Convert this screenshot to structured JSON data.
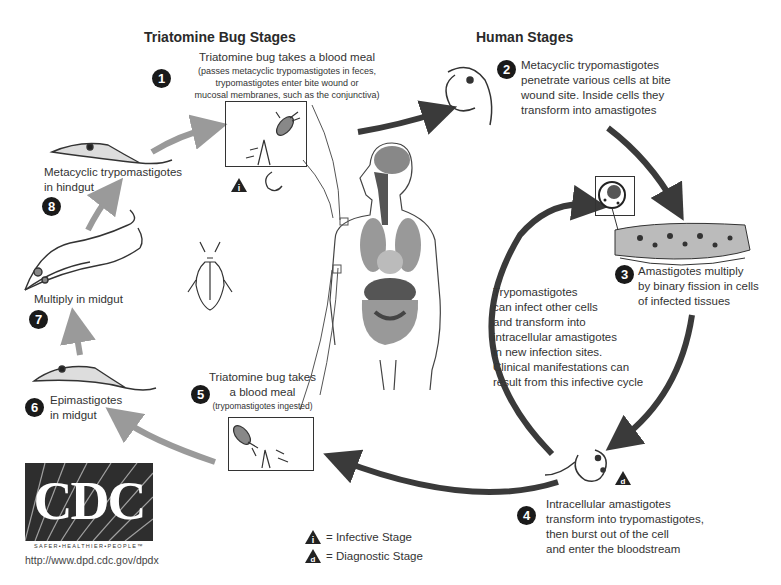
{
  "headings": {
    "triatomine": "Triatomine Bug Stages",
    "human": "Human Stages"
  },
  "stages": [
    {
      "number": "1",
      "title": "Triatomine bug takes a blood meal",
      "detail": [
        "(passes metacyclic trypomastigotes in feces,",
        "trypomastigotes enter bite wound or",
        "mucosal membranes, such as the conjunctiva)"
      ]
    },
    {
      "number": "2",
      "lines": [
        "Metacyclic trypomastigotes",
        "penetrate various cells at bite",
        "wound site. Inside cells they",
        "transform into amastigotes"
      ]
    },
    {
      "number": "3",
      "lines": [
        "Amastigotes multiply",
        "by binary fission in cells",
        "of infected tissues"
      ]
    },
    {
      "number": "4",
      "lines": [
        "Intracellular amastigotes",
        "transform into trypomastigotes,",
        "then burst out of the cell",
        "and enter the bloodstream"
      ]
    },
    {
      "number": "5",
      "lines": [
        "Triatomine bug takes",
        "a blood meal"
      ],
      "detail": "(trypomastigotes ingested)"
    },
    {
      "number": "6",
      "lines": [
        "Epimastigotes",
        "in midgut"
      ]
    },
    {
      "number": "7",
      "lines": [
        "Multiply in midgut"
      ]
    },
    {
      "number": "8",
      "lines": [
        "Metacyclic trypomastigotes",
        "in hindgut"
      ]
    }
  ],
  "cycle_note": [
    "Trypomastigotes",
    "can infect other cells",
    "and transform into",
    "intracellular amastigotes",
    "in new infection sites.",
    "Clinical manifestations can",
    "result from this infective cycle"
  ],
  "legend": {
    "infective": {
      "symbol": "i",
      "label": "= Infective Stage"
    },
    "diagnostic": {
      "symbol": "d",
      "label": "= Diagnostic Stage"
    }
  },
  "logo": {
    "text": "CDC",
    "tagline": "SAFER•HEALTHIER•PEOPLE™",
    "url": "http://www.dpd.cdc.gov/dpdx"
  },
  "colors": {
    "human_arrow": "#3a3a3a",
    "bug_arrow": "#9a9a9a",
    "badge": "#1a1a1a"
  }
}
